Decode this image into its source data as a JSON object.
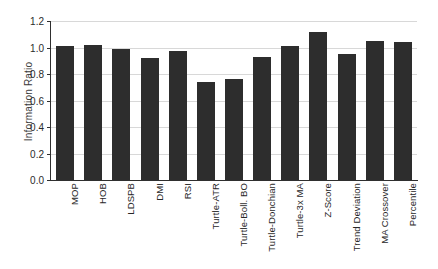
{
  "chart_data": {
    "type": "bar",
    "title": "",
    "xlabel": "",
    "ylabel": "Information Ratio",
    "ylim": [
      0.0,
      1.2
    ],
    "ytick_labels": [
      "0.0",
      "0.2",
      "0.4",
      "0.6",
      "0.8",
      "1.0",
      "1.2"
    ],
    "ytick_values": [
      0.0,
      0.2,
      0.4,
      0.6,
      0.8,
      1.0,
      1.2
    ],
    "grid": "horizontal",
    "legend": "none",
    "bar_color": "#2d2d2d",
    "categories": [
      "MOP",
      "HOB",
      "LDSPB",
      "DMI",
      "RSI",
      "Turtle-ATR",
      "Turtle-Boll. BO",
      "Turtle-Donchian",
      "Turtle-3x MA",
      "Z-Score",
      "Trend Deviation",
      "MA Crossover",
      "Percentile"
    ],
    "values": [
      1.01,
      1.02,
      0.99,
      0.92,
      0.97,
      0.74,
      0.76,
      0.93,
      1.01,
      1.12,
      0.95,
      1.05,
      1.04
    ]
  }
}
